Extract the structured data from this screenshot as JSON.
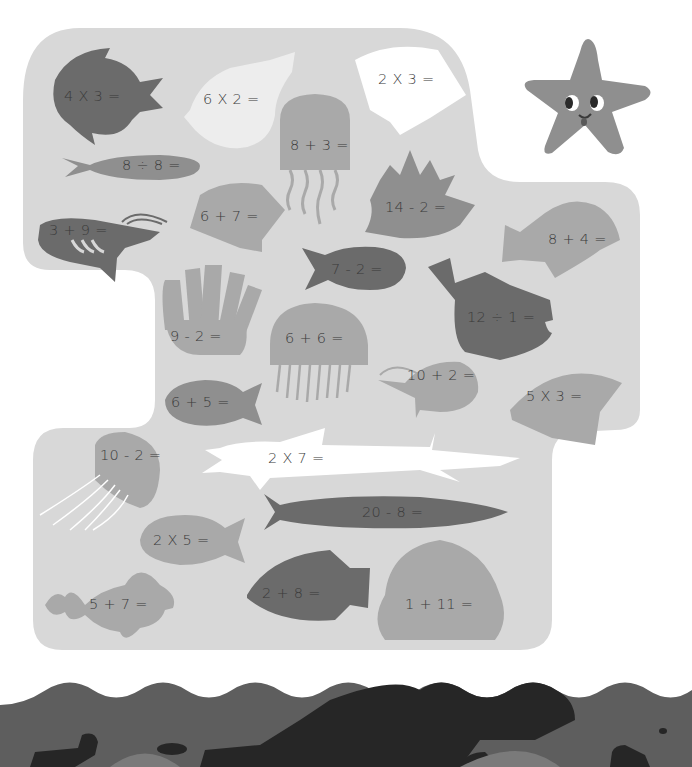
{
  "page": {
    "colors": {
      "panel": "#d8d8d8",
      "dark": "#6b6b6b",
      "mid": "#8f8f8f",
      "light": "#a9a9a9",
      "white": "#ffffff",
      "wave_mid": "#5e5e5e",
      "wave_dark": "#262626",
      "wave_light": "#7a7a7a",
      "text": "#3a3a3a"
    }
  },
  "starfish": {
    "label": "smiling starfish"
  },
  "creatures": [
    {
      "id": "round-fish-top-left",
      "shape": "round-fish",
      "equation": "4 X 3 ="
    },
    {
      "id": "conch-shell",
      "shape": "conch",
      "equation": "6 X 2 ="
    },
    {
      "id": "scallop-white-top",
      "shape": "scallop",
      "equation": "2 X 3 ="
    },
    {
      "id": "jellyfish-top",
      "shape": "jellyfish",
      "equation": "8 + 3 ="
    },
    {
      "id": "long-fish-top",
      "shape": "slim-fish",
      "equation": "8 ÷ 8 ="
    },
    {
      "id": "scallop-small",
      "shape": "scallop",
      "equation": "6 + 7 ="
    },
    {
      "id": "sea-anemone-blob",
      "shape": "blob",
      "equation": "14 - 2 ="
    },
    {
      "id": "shrimp-left",
      "shape": "shrimp",
      "equation": "3 + 9 ="
    },
    {
      "id": "small-fish-middle",
      "shape": "fish",
      "equation": "7 - 2 ="
    },
    {
      "id": "angelfish-right",
      "shape": "angelfish",
      "equation": "8 + 4 ="
    },
    {
      "id": "pufferfish",
      "shape": "puffer",
      "equation": "12 ÷ 1 ="
    },
    {
      "id": "anemone",
      "shape": "anemone",
      "equation": "9 - 2 ="
    },
    {
      "id": "jellyfish-middle",
      "shape": "jellyfish",
      "equation": "6 + 6 ="
    },
    {
      "id": "shrimp-right",
      "shape": "shrimp",
      "equation": "10 + 2 ="
    },
    {
      "id": "fish-small-left",
      "shape": "fish",
      "equation": "6 + 5 ="
    },
    {
      "id": "scallop-right",
      "shape": "scallop",
      "equation": "5 X 3 ="
    },
    {
      "id": "jellyfish-bottom",
      "shape": "jellyfish",
      "equation": "10 - 2 ="
    },
    {
      "id": "barracuda-white",
      "shape": "barracuda",
      "equation": "2 X 7 ="
    },
    {
      "id": "long-fish-bottom",
      "shape": "slim-fish",
      "equation": "20 - 8 ="
    },
    {
      "id": "fish-bottom-left",
      "shape": "fish",
      "equation": "2 X 5 ="
    },
    {
      "id": "angelfish-bottom",
      "shape": "angelfish",
      "equation": "2 + 8 ="
    },
    {
      "id": "scallop-bottom",
      "shape": "scallop",
      "equation": "1 + 11 ="
    },
    {
      "id": "fantail-fish",
      "shape": "fantail",
      "equation": "5 + 7 ="
    }
  ]
}
